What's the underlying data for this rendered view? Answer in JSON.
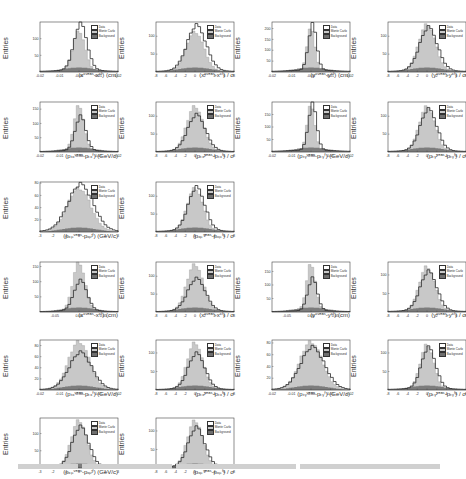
{
  "figure": {
    "legend": [
      "Data",
      "Monte Carlo",
      "Background"
    ],
    "colors": {
      "data_line": "#2a2a2a",
      "mc_fill": "#c8c8c8",
      "bg_fill": "#6e6e6e",
      "frame": "#444444"
    }
  },
  "chart_data": [
    {
      "type": "bar",
      "title": "",
      "xlabel": "(xᶜᵛᵉᵃˢ-xᶜᶠ) (cm)",
      "ylabel": "Entries",
      "xlim": [
        -0.02,
        0.02
      ],
      "xticks": [
        "-0.02",
        "-0.01",
        "-0.00",
        "0.01",
        "0.02"
      ],
      "yticks": [
        "50",
        "100"
      ],
      "ylim": [
        0,
        150
      ],
      "legend": [
        "Data",
        "Monte Carlo",
        "Background"
      ],
      "peak_data": 140,
      "peak_mc": 120,
      "width": 0.22
    },
    {
      "type": "bar",
      "title": "",
      "xlabel": "(xᶜᵛᵉᵃˢ-xᶜᶠ) / σ",
      "ylabel": "Entries",
      "xlim": [
        -8,
        8
      ],
      "xticks": [
        "-8",
        "-6",
        "-4",
        "-2",
        "0",
        "2",
        "4",
        "6",
        "8"
      ],
      "yticks": [
        "50",
        "100"
      ],
      "ylim": [
        0,
        140
      ],
      "legend": [
        "Data",
        "Monte Carlo",
        "Background"
      ],
      "peak_data": 125,
      "peak_mc": 110,
      "width": 0.32
    },
    {
      "type": "bar",
      "title": "",
      "xlabel": "(yᶜᵛᵉᵃˢ-yᶜᶠ) (cm)",
      "ylabel": "Entries",
      "xlim": [
        -0.02,
        0.02
      ],
      "xticks": [
        "-0.02",
        "-0.01",
        "-0.00",
        "0.01",
        "0.02"
      ],
      "yticks": [
        "50",
        "100",
        "150",
        "200"
      ],
      "ylim": [
        0,
        230
      ],
      "legend": [
        "Data",
        "Monte Carlo",
        "Background"
      ],
      "peak_data": 210,
      "peak_mc": 200,
      "width": 0.14
    },
    {
      "type": "bar",
      "title": "",
      "xlabel": "(yᶜᵛᵉᵃˢ-yᶜᶠ) / σ",
      "ylabel": "Entries",
      "xlim": [
        -8,
        8
      ],
      "xticks": [
        "-8",
        "-6",
        "-4",
        "-2",
        "0",
        "2",
        "4",
        "6",
        "8"
      ],
      "yticks": [
        "50",
        "100"
      ],
      "ylim": [
        0,
        140
      ],
      "legend": [
        "Data",
        "Monte Carlo",
        "Background"
      ],
      "peak_data": 120,
      "peak_mc": 130,
      "width": 0.3
    },
    {
      "type": "bar",
      "title": "",
      "xlabel": "(pₜₓᵛᵉᵃˢ-pₜₓᶠ) (GeV/c)",
      "ylabel": "Entries",
      "xlim": [
        -0.02,
        0.02
      ],
      "xticks": [
        "-0.02",
        "-0.01",
        "-0.00",
        "0.01",
        "0.02"
      ],
      "yticks": [
        "50",
        "100",
        "150"
      ],
      "ylim": [
        0,
        175
      ],
      "legend": [
        "Data",
        "Monte Carlo",
        "Background"
      ],
      "peak_data": 120,
      "peak_mc": 160,
      "width": 0.18
    },
    {
      "type": "bar",
      "title": "",
      "xlabel": "(pₜₓᵛᵉᵃˢ-pₜₓᶠ) / σ",
      "ylabel": "Entries",
      "xlim": [
        -8,
        8
      ],
      "xticks": [
        "-8",
        "-6",
        "-4",
        "-2",
        "0",
        "2",
        "4",
        "6",
        "8"
      ],
      "yticks": [
        "50",
        "100"
      ],
      "ylim": [
        0,
        140
      ],
      "legend": [
        "Data",
        "Monte Carlo",
        "Background"
      ],
      "peak_data": 100,
      "peak_mc": 125,
      "width": 0.3
    },
    {
      "type": "bar",
      "title": "",
      "xlabel": "(pₜᵧᵛᵉᵃˢ-pₜᵧᶠ) (GeV/c)",
      "ylabel": "Entries",
      "xlim": [
        -0.02,
        0.02
      ],
      "xticks": [
        "-0.02",
        "-0.01",
        "-0.00",
        "0.01",
        "0.02"
      ],
      "yticks": [
        "50",
        "100",
        "150"
      ],
      "ylim": [
        0,
        200
      ],
      "legend": [
        "Data",
        "Monte Carlo",
        "Background"
      ],
      "peak_data": 185,
      "peak_mc": 185,
      "width": 0.14
    },
    {
      "type": "bar",
      "title": "",
      "xlabel": "(pₜᵧᵛᵉᵃˢ-pₜᵧᶠ) / σ",
      "ylabel": "Entries",
      "xlim": [
        -8,
        8
      ],
      "xticks": [
        "-8",
        "-6",
        "-4",
        "-2",
        "0",
        "2",
        "4",
        "6",
        "8"
      ],
      "yticks": [
        "50",
        "100"
      ],
      "ylim": [
        0,
        140
      ],
      "legend": [
        "Data",
        "Monte Carlo",
        "Background"
      ],
      "peak_data": 115,
      "peak_mc": 125,
      "width": 0.28
    },
    {
      "type": "bar",
      "title": "",
      "xlabel": "(pₓₚᵛᵉᵃˢ-pₓₚᶠ) (GeV/c)",
      "ylabel": "Entries",
      "xlim": [
        -3,
        3
      ],
      "xticks": [
        "-3",
        "-2",
        "-1",
        "0",
        "1",
        "2",
        "3"
      ],
      "yticks": [
        "20",
        "40",
        "60",
        "80"
      ],
      "ylim": [
        0,
        82
      ],
      "legend": [
        "Data",
        "Monte Carlo",
        "Background"
      ],
      "peak_data": 75,
      "peak_mc": 70,
      "width": 0.42
    },
    {
      "type": "bar",
      "title": "",
      "xlabel": "(pₓₚᵛᵉᵃˢ-pₓₚᶠ) / σ",
      "ylabel": "Entries",
      "xlim": [
        -8,
        8
      ],
      "xticks": [
        "-8",
        "-6",
        "-4",
        "-2",
        "0",
        "2",
        "4",
        "6",
        "8"
      ],
      "yticks": [
        "50",
        "100"
      ],
      "ylim": [
        0,
        140
      ],
      "legend": [
        "Data",
        "Monte Carlo",
        "Background"
      ],
      "peak_data": 120,
      "peak_mc": 120,
      "width": 0.28
    },
    {
      "type": "bar",
      "title": "",
      "xlabel": "(xᶜᵛᵉᵃˢ-xᶜᶠ) (cm)",
      "ylabel": "Entries",
      "xlim": [
        -0.08,
        0.08
      ],
      "xticks": [
        "-0.05",
        "0.00",
        "0.05"
      ],
      "yticks": [
        "50",
        "100",
        "150"
      ],
      "ylim": [
        0,
        165
      ],
      "legend": [
        "Data",
        "Monte Carlo",
        "Background"
      ],
      "peak_data": 100,
      "peak_mc": 160,
      "width": 0.22
    },
    {
      "type": "bar",
      "title": "",
      "xlabel": "(xᶜᵛᵉᵃˢ-xᶜᶠ) / σ",
      "ylabel": "Entries",
      "xlim": [
        -8,
        8
      ],
      "xticks": [
        "-8",
        "-6",
        "-4",
        "-2",
        "0",
        "2",
        "4",
        "6",
        "8"
      ],
      "yticks": [
        "50",
        "100"
      ],
      "ylim": [
        0,
        140
      ],
      "legend": [
        "Data",
        "Monte Carlo",
        "Background"
      ],
      "peak_data": 90,
      "peak_mc": 130,
      "width": 0.3
    },
    {
      "type": "bar",
      "title": "",
      "xlabel": "(yᶜᵛᵉᵃˢ-yᶜᶠ) (cm)",
      "ylabel": "Entries",
      "xlim": [
        -0.08,
        0.08
      ],
      "xticks": [
        "-0.05",
        "0.00",
        "0.05"
      ],
      "yticks": [
        "50",
        "100",
        "150"
      ],
      "ylim": [
        0,
        185
      ],
      "legend": [
        "Data",
        "Monte Carlo",
        "Background"
      ],
      "peak_data": 120,
      "peak_mc": 175,
      "width": 0.16
    },
    {
      "type": "bar",
      "title": "",
      "xlabel": "(yᶜᵛᵉᵃˢ-yᶜᶠ) / σ",
      "ylabel": "Entries",
      "xlim": [
        -8,
        8
      ],
      "xticks": [
        "-8",
        "-6",
        "-4",
        "-2",
        "0",
        "2",
        "4",
        "6",
        "8"
      ],
      "yticks": [
        "50",
        "100"
      ],
      "ylim": [
        0,
        135
      ],
      "legend": [
        "Data",
        "Monte Carlo",
        "Background"
      ],
      "peak_data": 105,
      "peak_mc": 120,
      "width": 0.28
    },
    {
      "type": "bar",
      "title": "",
      "xlabel": "(pₜₓᵛᵉᵃˢ-pₜₓᶠ) (GeV/c)",
      "ylabel": "Entries",
      "xlim": [
        -0.02,
        0.02
      ],
      "xticks": [
        "-0.02",
        "-0.01",
        "-0.00",
        "0.01",
        "0.02"
      ],
      "yticks": [
        "20",
        "40",
        "60",
        "80"
      ],
      "ylim": [
        0,
        90
      ],
      "legend": [
        "Data",
        "Monte Carlo",
        "Background"
      ],
      "peak_data": 65,
      "peak_mc": 85,
      "width": 0.38
    },
    {
      "type": "bar",
      "title": "",
      "xlabel": "(pₜₓᵛᵉᵃˢ-pₜₓᶠ) / σ",
      "ylabel": "Entries",
      "xlim": [
        -8,
        8
      ],
      "xticks": [
        "-8",
        "-6",
        "-4",
        "-2",
        "0",
        "2",
        "4",
        "6",
        "8"
      ],
      "yticks": [
        "50",
        "100"
      ],
      "ylim": [
        0,
        135
      ],
      "legend": [
        "Data",
        "Monte Carlo",
        "Background"
      ],
      "peak_data": 95,
      "peak_mc": 125,
      "width": 0.28
    },
    {
      "type": "bar",
      "title": "",
      "xlabel": "(pₜᵧᵛᵉᵃˢ-pₜᵧᶠ) (GeV/c)",
      "ylabel": "Entries",
      "xlim": [
        -0.02,
        0.02
      ],
      "xticks": [
        "-0.02",
        "-0.01",
        "-0.00",
        "0.01",
        "0.02"
      ],
      "yticks": [
        "20",
        "40",
        "60",
        "80"
      ],
      "ylim": [
        0,
        85
      ],
      "legend": [
        "Data",
        "Monte Carlo",
        "Background"
      ],
      "peak_data": 70,
      "peak_mc": 80,
      "width": 0.4
    },
    {
      "type": "bar",
      "title": "",
      "xlabel": "(pₜᵧᵛᵉᵃˢ-pₜᵧᶠ) / σ",
      "ylabel": "Entries",
      "xlim": [
        -8,
        8
      ],
      "xticks": [
        "-8",
        "-6",
        "-4",
        "-2",
        "0",
        "2",
        "4",
        "6",
        "8"
      ],
      "yticks": [
        "50",
        "100"
      ],
      "ylim": [
        0,
        135
      ],
      "legend": [
        "Data",
        "Monte Carlo",
        "Background"
      ],
      "peak_data": 110,
      "peak_mc": 120,
      "width": 0.24
    },
    {
      "type": "bar",
      "title": "",
      "xlabel": "(pₓₚᵛᵉᵃˢ-pₓₚᶠ) (GeV/c)",
      "ylabel": "Entries",
      "xlim": [
        -3,
        3
      ],
      "xticks": [
        "-3",
        "-2",
        "-1",
        "0",
        "1",
        "2",
        "3"
      ],
      "yticks": [
        "50",
        "100"
      ],
      "ylim": [
        0,
        145
      ],
      "legend": [
        "Data",
        "Monte Carlo",
        "Background"
      ],
      "peak_data": 115,
      "peak_mc": 135,
      "width": 0.28
    },
    {
      "type": "bar",
      "title": "",
      "xlabel": "(pₓₚᵛᵉᵃˢ-pₓₚᶠ) / σ",
      "ylabel": "Entries",
      "xlim": [
        -8,
        8
      ],
      "xticks": [
        "-8",
        "-6",
        "-4",
        "-2",
        "0",
        "2",
        "4",
        "6",
        "8"
      ],
      "yticks": [
        "50",
        "100"
      ],
      "ylim": [
        0,
        135
      ],
      "legend": [
        "Data",
        "Monte Carlo",
        "Background"
      ],
      "peak_data": 105,
      "peak_mc": 125,
      "width": 0.28
    }
  ],
  "layout": {
    "positions": [
      [
        2,
        0
      ],
      [
        118,
        0
      ],
      [
        234,
        0
      ],
      [
        350,
        0
      ],
      [
        2,
        80
      ],
      [
        118,
        80
      ],
      [
        234,
        80
      ],
      [
        350,
        80
      ],
      [
        2,
        160
      ],
      [
        118,
        160
      ],
      [
        2,
        240
      ],
      [
        118,
        240
      ],
      [
        234,
        240
      ],
      [
        350,
        240
      ],
      [
        2,
        318
      ],
      [
        118,
        318
      ],
      [
        234,
        318
      ],
      [
        350,
        318
      ],
      [
        2,
        396
      ],
      [
        118,
        396
      ]
    ]
  }
}
